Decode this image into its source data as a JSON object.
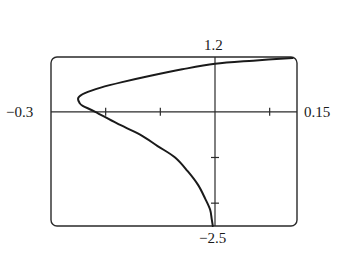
{
  "chart_data": {
    "type": "line",
    "title": "",
    "xlabel": "",
    "ylabel": "",
    "xlim": [
      -0.3,
      0.15
    ],
    "ylim": [
      -2.5,
      1.2
    ],
    "x_ticks": [
      -0.2,
      -0.1,
      0.1
    ],
    "y_ticks": [
      -1,
      -2
    ],
    "grid": false,
    "legend": null,
    "axis_labels": {
      "x_min": "−0.3",
      "x_max": "0.15",
      "y_max": "1.2",
      "y_min": "−2.5"
    },
    "series": [
      {
        "name": "curve",
        "points": [
          [
            0.142,
            1.18
          ],
          [
            0.07,
            1.12
          ],
          [
            0.0,
            1.05
          ],
          [
            -0.06,
            0.93
          ],
          [
            -0.118,
            0.79
          ],
          [
            -0.17,
            0.65
          ],
          [
            -0.209,
            0.53
          ],
          [
            -0.238,
            0.41
          ],
          [
            -0.25,
            0.31
          ],
          [
            -0.248,
            0.2
          ],
          [
            -0.242,
            0.13
          ],
          [
            -0.219,
            0.0
          ],
          [
            -0.18,
            -0.25
          ],
          [
            -0.137,
            -0.5
          ],
          [
            -0.105,
            -0.75
          ],
          [
            -0.073,
            -1.0
          ],
          [
            -0.05,
            -1.3
          ],
          [
            -0.031,
            -1.6
          ],
          [
            -0.018,
            -1.9
          ],
          [
            -0.009,
            -2.14
          ],
          [
            -0.006,
            -2.35
          ],
          [
            -0.004,
            -2.5
          ]
        ]
      }
    ]
  },
  "colors": {
    "line": "#1a1a1a",
    "frame": "#2a2a2a",
    "background": "#ffffff"
  }
}
